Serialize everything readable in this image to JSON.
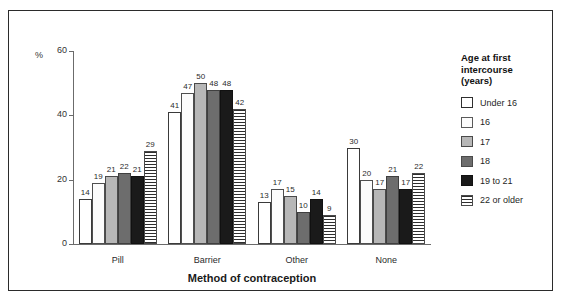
{
  "chart_data": {
    "type": "bar",
    "title": "",
    "xlabel": "Method of contraception",
    "ylabel": "%",
    "ylim": [
      0,
      60
    ],
    "yticks": [
      0,
      20,
      40,
      60
    ],
    "grid": false,
    "legend_position": "right",
    "legend_title": "Age at first intercourse (years)",
    "categories": [
      "Pill",
      "Barrier",
      "Other",
      "None"
    ],
    "series": [
      {
        "name": "Under 16",
        "fill": "white-outline",
        "values": [
          14,
          41,
          13,
          30
        ]
      },
      {
        "name": "16",
        "fill": "white",
        "values": [
          19,
          47,
          17,
          20
        ]
      },
      {
        "name": "17",
        "fill": "light-gray",
        "values": [
          21,
          50,
          15,
          17
        ]
      },
      {
        "name": "18",
        "fill": "medium-gray",
        "values": [
          22,
          48,
          10,
          21
        ]
      },
      {
        "name": "19 to 21",
        "fill": "black",
        "values": [
          21,
          48,
          14,
          17
        ]
      },
      {
        "name": "22 or older",
        "fill": "horizontal-lines",
        "values": [
          29,
          42,
          9,
          22
        ]
      }
    ]
  },
  "axes": {
    "y_unit_label": "%",
    "y_tick_labels": [
      "60",
      "40",
      "20",
      "0"
    ],
    "x_axis_title": "Method of contraception",
    "x_tick_labels": [
      "Pill",
      "Barrier",
      "Other",
      "None"
    ]
  },
  "legend": {
    "title_line1": "Age at first",
    "title_line2": "intercourse",
    "title_line3": "(years)",
    "items": [
      {
        "label": "Under 16"
      },
      {
        "label": "16"
      },
      {
        "label": "17"
      },
      {
        "label": "18"
      },
      {
        "label": "19 to 21"
      },
      {
        "label": "22 or older"
      }
    ]
  },
  "colors": {
    "frame": "#2b2b2b",
    "axis": "#6b6b6b",
    "text": "#1f1f1f",
    "series_light_gray": "#b7b7b7",
    "series_medium_gray": "#6d6d6d",
    "series_black": "#1a1a1a"
  }
}
